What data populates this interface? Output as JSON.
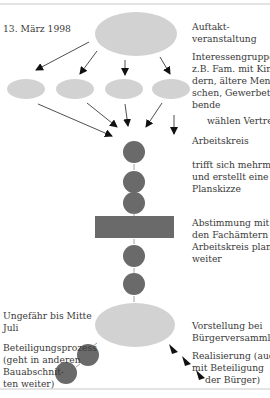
{
  "colors": {
    "light_shape": "#d2d2d2",
    "dark_shape": "#6a6a6a",
    "arrow": "#111111",
    "border": "#e4e4e4"
  },
  "labels": {
    "date_start": "13. März 1998",
    "kickoff": [
      "Auftakt-",
      "veranstaltung"
    ],
    "interest_groups": [
      "Interessengruppen:",
      "z.B. Fam. mit Kin-",
      "dern, ältere Men-",
      "schen, Gewerbetrei-",
      "bende"
    ],
    "elect_reps": "wählen Vertreter",
    "working_group": "Arbeitskreis",
    "meets": [
      "trifft sich mehrmals",
      "und erstellt eine",
      "Planskizze"
    ],
    "coordination": [
      "Abstimmung mit",
      "den Fachämtern",
      "Arbeitskreis plant",
      "weiter"
    ],
    "date_end": [
      "Ungefähr bis Mitte",
      "Juli"
    ],
    "participation": [
      "Beteiligungsprozess",
      "(geht in anderen",
      "Bauabschnit-",
      "ten weiter)"
    ],
    "presentation": [
      "Vorstellung bei",
      "Bürgerversammlung"
    ],
    "realization": [
      "Realisierung (auch",
      "mit Beteiligung",
      "der Bürger)"
    ]
  }
}
